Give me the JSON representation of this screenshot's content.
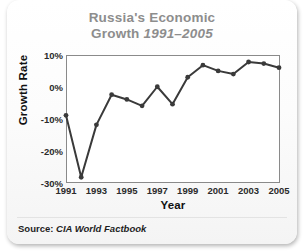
{
  "card": {
    "title_line1": "Russia's Economic",
    "title_line2_prefix": "Growth",
    "title_years": "1991–2005",
    "source_label": "Source:",
    "source_value": "CIA World Factbook"
  },
  "chart_data": {
    "type": "line",
    "title": "Russia's Economic Growth 1991–2005",
    "subtitle": "",
    "xlabel": "Year",
    "ylabel": "Growth Rate",
    "x": [
      1991,
      1992,
      1993,
      1994,
      1995,
      1996,
      1997,
      1998,
      1999,
      2000,
      2001,
      2002,
      2003,
      2004,
      2005
    ],
    "values": [
      -9.0,
      -28.5,
      -12.0,
      -2.5,
      -4.0,
      -6.0,
      0.0,
      -5.5,
      3.0,
      6.8,
      5.0,
      4.0,
      7.8,
      7.3,
      6.0
    ],
    "series": [
      {
        "name": "Growth Rate",
        "values": [
          -9.0,
          -28.5,
          -12.0,
          -2.5,
          -4.0,
          -6.0,
          0.0,
          -5.5,
          3.0,
          6.8,
          5.0,
          4.0,
          7.8,
          7.3,
          6.0
        ]
      }
    ],
    "y_ticks": [
      10,
      0,
      -10,
      -20,
      -30
    ],
    "y_tick_labels": [
      "10%",
      "0%",
      "-10%",
      "-20%",
      "-30%"
    ],
    "x_ticks": [
      1991,
      1993,
      1995,
      1997,
      1999,
      2001,
      2003,
      2005
    ],
    "x_tick_labels": [
      "1991",
      "1993",
      "1995",
      "1997",
      "1999",
      "2001",
      "2003",
      "2005"
    ],
    "xlim": [
      1991,
      2005
    ],
    "ylim": [
      -30,
      10
    ],
    "grid": true,
    "legend": "none",
    "line_color": "#3a3a3a",
    "marker_color": "#3a3a3a",
    "grid_color": "#d9d9d9",
    "title_color": "#8d8d8d",
    "axis_color": "#8a8a8a",
    "unit": "%"
  }
}
